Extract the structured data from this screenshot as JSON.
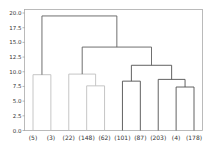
{
  "chart_data": {
    "type": "dendrogram",
    "title": "",
    "xlabel": "",
    "ylabel": "",
    "ylim": [
      0,
      20.5
    ],
    "yticks": [
      "0.0",
      "2.5",
      "5.0",
      "7.5",
      "10.0",
      "12.5",
      "15.0",
      "17.5",
      "20.0"
    ],
    "ytick_values": [
      0,
      2.5,
      5,
      7.5,
      10,
      12.5,
      15,
      17.5,
      20
    ],
    "leaves": [
      "(5)",
      "(3)",
      "(22)",
      "(148)",
      "(62)",
      "(101)",
      "(87)",
      "(203)",
      "(4)",
      "(178)"
    ],
    "links": [
      {
        "left": [
          0,
          0
        ],
        "right": [
          1,
          0
        ],
        "height": 9.5,
        "color": "#c0c0c0"
      },
      {
        "left": [
          3,
          0
        ],
        "right": [
          4,
          0
        ],
        "height": 7.6,
        "color": "#c0c0c0"
      },
      {
        "left": [
          2,
          0
        ],
        "right": [
          3.5,
          7.6
        ],
        "height": 9.6,
        "color": "#c0c0c0"
      },
      {
        "left": [
          5,
          0
        ],
        "right": [
          6,
          0
        ],
        "height": 8.4,
        "color": "#505050"
      },
      {
        "left": [
          8,
          0
        ],
        "right": [
          9,
          0
        ],
        "height": 7.4,
        "color": "#505050"
      },
      {
        "left": [
          7,
          0
        ],
        "right": [
          8.5,
          7.4
        ],
        "height": 8.7,
        "color": "#505050"
      },
      {
        "left": [
          5.5,
          8.4
        ],
        "right": [
          7.75,
          8.7
        ],
        "height": 11.1,
        "color": "#505050"
      },
      {
        "left": [
          2.75,
          9.6
        ],
        "right": [
          6.625,
          11.1
        ],
        "height": 14.2,
        "color": "#606060"
      },
      {
        "left": [
          0.5,
          9.5
        ],
        "right": [
          4.6875,
          14.2
        ],
        "height": 19.5,
        "color": "#606060"
      }
    ],
    "colors": {
      "frame": "#aaaaaa",
      "tick": "#888888"
    }
  }
}
